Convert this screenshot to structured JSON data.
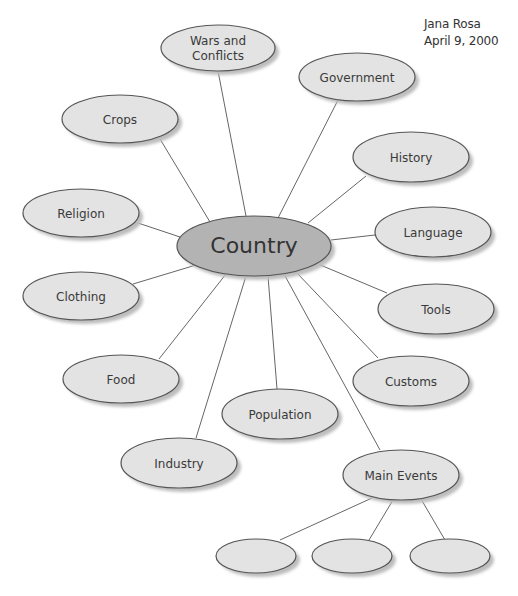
{
  "author": {
    "name": "Jana Rosa",
    "date": "April 9, 2000"
  },
  "colors": {
    "node_fill": "#e3e3e3",
    "center_fill": "#b3b3b3",
    "stroke": "#555555",
    "shadow": "#bdbdbd",
    "line": "#666666"
  },
  "center": {
    "label": "Country",
    "cx": 254,
    "cy": 246,
    "rx": 77,
    "ry": 30
  },
  "nodes": [
    {
      "id": "wars",
      "lines": [
        "Wars and",
        "Conflicts"
      ],
      "cx": 218,
      "cy": 48,
      "rx": 57,
      "ry": 23,
      "ax": 218,
      "ay": 71,
      "bx": 246,
      "by": 216
    },
    {
      "id": "government",
      "lines": [
        "Government"
      ],
      "cx": 357,
      "cy": 77,
      "rx": 58,
      "ry": 24,
      "ax": 338,
      "ay": 100,
      "bx": 278,
      "by": 218
    },
    {
      "id": "crops",
      "lines": [
        "Crops"
      ],
      "cx": 120,
      "cy": 119,
      "rx": 58,
      "ry": 24,
      "ax": 160,
      "ay": 139,
      "bx": 210,
      "by": 222
    },
    {
      "id": "history",
      "lines": [
        "History"
      ],
      "cx": 411,
      "cy": 157,
      "rx": 58,
      "ry": 25,
      "ax": 366,
      "ay": 176,
      "bx": 308,
      "by": 223
    },
    {
      "id": "religion",
      "lines": [
        "Religion"
      ],
      "cx": 81,
      "cy": 213,
      "rx": 58,
      "ry": 24,
      "ax": 135,
      "ay": 222,
      "bx": 180,
      "by": 237
    },
    {
      "id": "language",
      "lines": [
        "Language"
      ],
      "cx": 433,
      "cy": 232,
      "rx": 58,
      "ry": 25,
      "ax": 375,
      "ay": 235,
      "bx": 331,
      "by": 240
    },
    {
      "id": "clothing",
      "lines": [
        "Clothing"
      ],
      "cx": 81,
      "cy": 296,
      "rx": 58,
      "ry": 24,
      "ax": 133,
      "ay": 284,
      "bx": 196,
      "by": 265
    },
    {
      "id": "tools",
      "lines": [
        "Tools"
      ],
      "cx": 436,
      "cy": 309,
      "rx": 58,
      "ry": 25,
      "ax": 387,
      "ay": 293,
      "bx": 318,
      "by": 264
    },
    {
      "id": "food",
      "lines": [
        "Food"
      ],
      "cx": 121,
      "cy": 379,
      "rx": 58,
      "ry": 24,
      "ax": 159,
      "ay": 359,
      "bx": 226,
      "by": 274
    },
    {
      "id": "customs",
      "lines": [
        "Customs"
      ],
      "cx": 411,
      "cy": 381,
      "rx": 58,
      "ry": 25,
      "ax": 378,
      "ay": 358,
      "bx": 296,
      "by": 272
    },
    {
      "id": "population",
      "lines": [
        "Population"
      ],
      "cx": 280,
      "cy": 414,
      "rx": 58,
      "ry": 25,
      "ax": 277,
      "ay": 389,
      "bx": 268,
      "by": 276
    },
    {
      "id": "industry",
      "lines": [
        "Industry"
      ],
      "cx": 179,
      "cy": 463,
      "rx": 58,
      "ry": 25,
      "ax": 196,
      "ay": 438,
      "bx": 246,
      "by": 276
    },
    {
      "id": "main_events",
      "lines": [
        "Main Events"
      ],
      "cx": 401,
      "cy": 475,
      "rx": 58,
      "ry": 25,
      "ax": 380,
      "ay": 450,
      "bx": 284,
      "by": 274
    }
  ],
  "sub_nodes": [
    {
      "id": "event_1",
      "lines": [],
      "cx": 256,
      "cy": 556,
      "rx": 40,
      "ry": 17,
      "ax": 280,
      "ay": 540,
      "bx": 372,
      "by": 498
    },
    {
      "id": "event_2",
      "lines": [],
      "cx": 352,
      "cy": 556,
      "rx": 40,
      "ry": 17,
      "ax": 369,
      "ay": 540,
      "bx": 393,
      "by": 500
    },
    {
      "id": "event_3",
      "lines": [],
      "cx": 450,
      "cy": 556,
      "rx": 40,
      "ry": 17,
      "ax": 445,
      "ay": 540,
      "bx": 421,
      "by": 499
    }
  ]
}
